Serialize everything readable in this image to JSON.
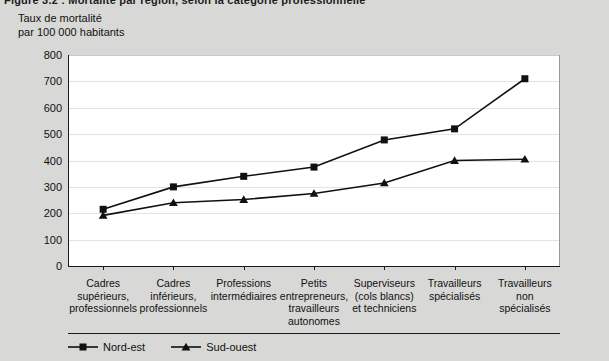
{
  "top_fragment": "Figure 3.2 : Mortalité par région, selon la catégorie professionnelle",
  "axis_caption": "Taux de mortalité\npar 100 000 habitants",
  "legend": {
    "items": [
      {
        "label": "Nord-est",
        "marker": "square-marker",
        "color": "#111111"
      },
      {
        "label": "Sud-ouest",
        "marker": "triangle-marker",
        "color": "#111111"
      }
    ]
  },
  "chart_data": {
    "type": "line",
    "title": "",
    "xlabel": "",
    "ylabel": "Taux de mortalité par 100 000 habitants",
    "ylim": [
      0,
      800
    ],
    "ytick_labels": [
      "800",
      "700",
      "600",
      "500",
      "400",
      "300",
      "200",
      "100",
      "0"
    ],
    "yticks": [
      800,
      700,
      600,
      500,
      400,
      300,
      200,
      100,
      0
    ],
    "grid": true,
    "legend_position": "bottom",
    "categories": [
      "Cadres\nsupérieurs,\nprofessionnels",
      "Cadres\ninférieurs,\nprofessionnels",
      "Professions\nintermédiaires",
      "Petits\nentrepreneurs,\ntravailleurs\nautonomes",
      "Superviseurs\n(cols blancs)\net techniciens",
      "Travailleurs\nspécialisés",
      "Travailleurs\nnon spécialisés"
    ],
    "series": [
      {
        "name": "Nord-est",
        "marker": "square",
        "color": "#111111",
        "values": [
          215,
          300,
          340,
          375,
          478,
          520,
          710
        ]
      },
      {
        "name": "Sud-ouest",
        "marker": "triangle",
        "color": "#111111",
        "values": [
          192,
          240,
          252,
          275,
          315,
          400,
          405
        ]
      }
    ]
  }
}
